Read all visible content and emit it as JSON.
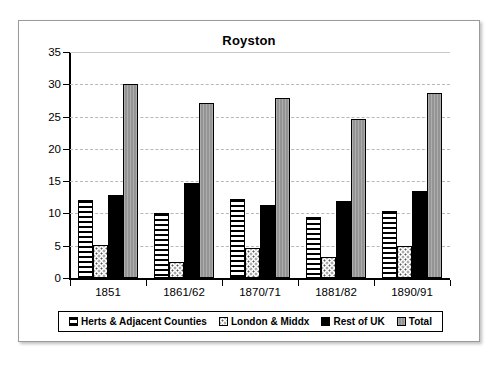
{
  "chart_data": {
    "type": "bar",
    "title": "Royston",
    "xlabel": "",
    "ylabel": "% Principal Providers",
    "ylim": [
      0,
      35
    ],
    "ytick_step": 5,
    "yticks": [
      0,
      5,
      10,
      15,
      20,
      25,
      30,
      35
    ],
    "grid": true,
    "legend_position": "bottom",
    "categories": [
      "1851",
      "1861/62",
      "1870/71",
      "1881/82",
      "1890/91"
    ],
    "series": [
      {
        "name": "Herts & Adjacent Counties",
        "pattern": "horizontal-lines",
        "color": "#ffffff",
        "values": [
          12.1,
          10.0,
          12.2,
          9.5,
          10.4
        ]
      },
      {
        "name": "London & Middx",
        "pattern": "dotted",
        "color": "#ffffff",
        "values": [
          5.1,
          2.5,
          4.6,
          3.3,
          5.0
        ]
      },
      {
        "name": "Rest of UK",
        "pattern": "solid",
        "color": "#000000",
        "values": [
          12.9,
          14.7,
          11.3,
          12.0,
          13.5
        ]
      },
      {
        "name": "Total",
        "pattern": "vertical-hatch",
        "color": "#9c9c9c",
        "values": [
          30.0,
          27.1,
          27.9,
          24.7,
          28.6
        ]
      }
    ]
  },
  "legend": {
    "items": [
      "Herts & Adjacent Counties",
      "London & Middx",
      "Rest of UK",
      "Total"
    ]
  }
}
